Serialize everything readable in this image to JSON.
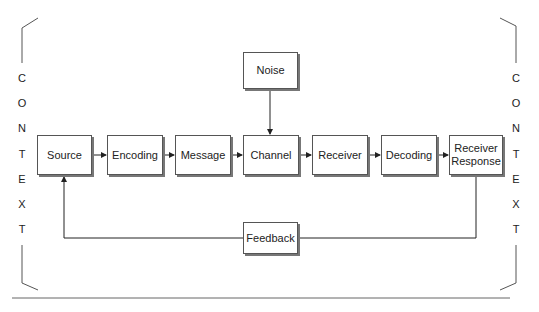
{
  "diagram": {
    "type": "communication-model",
    "context_label": "CONTEXT",
    "context_letters": [
      "C",
      "O",
      "N",
      "T",
      "E",
      "X",
      "T"
    ],
    "nodes": {
      "source": "Source",
      "encoding": "Encoding",
      "message": "Message",
      "channel": "Channel",
      "receiver": "Receiver",
      "decoding": "Decoding",
      "receiver_response_line1": "Receiver",
      "receiver_response_line2": "Response",
      "noise": "Noise",
      "feedback": "Feedback"
    },
    "edges": [
      [
        "Source",
        "Encoding"
      ],
      [
        "Encoding",
        "Message"
      ],
      [
        "Message",
        "Channel"
      ],
      [
        "Channel",
        "Receiver"
      ],
      [
        "Receiver",
        "Decoding"
      ],
      [
        "Decoding",
        "Receiver Response"
      ],
      [
        "Noise",
        "Channel"
      ],
      [
        "Receiver Response",
        "Feedback"
      ],
      [
        "Feedback",
        "Source"
      ]
    ]
  }
}
